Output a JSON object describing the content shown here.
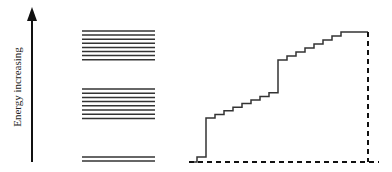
{
  "diagram": {
    "axis_label": "Energy increasing",
    "line_color": "#333333",
    "bands": [
      {
        "name": "upper-band",
        "levels": 8
      },
      {
        "name": "middle-band",
        "levels": 8
      },
      {
        "name": "lowest-band",
        "levels": 2
      }
    ],
    "staircase": {
      "description": "cumulative number of states vs energy",
      "segments": [
        {
          "label": "lowest",
          "steps": 2
        },
        {
          "label": "middle",
          "steps": 8
        },
        {
          "label": "upper",
          "steps": 8
        }
      ]
    }
  }
}
